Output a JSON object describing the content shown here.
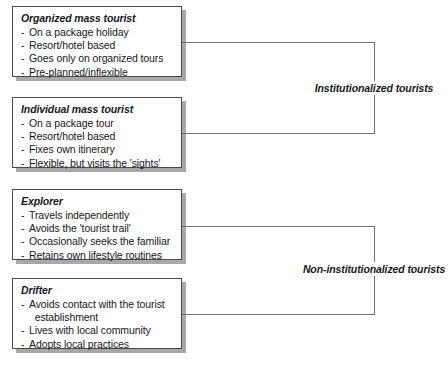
{
  "diagram": {
    "line_color": "#6f7276",
    "box_border_color": "#4a4a4a",
    "shadow_color": "#a8a8a8",
    "text_color": "#16181c",
    "boxes": [
      {
        "id": "organized-mass-tourist",
        "title": "Organized mass tourist",
        "bullets": [
          "On a package holiday",
          "Resort/hotel based",
          "Goes only on organized tours",
          "Pre-planned/inflexible"
        ]
      },
      {
        "id": "individual-mass-tourist",
        "title": "Individual mass tourist",
        "bullets": [
          "On a package tour",
          "Resort/hotel based",
          "Fixes own itinerary",
          "Flexible, but visits the 'sights'"
        ]
      },
      {
        "id": "explorer",
        "title": "Explorer",
        "bullets": [
          "Travels independently",
          "Avoids the 'tourist trail'",
          "Occasionally seeks the familiar",
          "Retains own lifestyle routines"
        ]
      },
      {
        "id": "drifter",
        "title": "Drifter",
        "bullets": [
          "Avoids contact with the tourist\n  establishment",
          "Lives with local community",
          "Adopts local practices"
        ]
      }
    ],
    "group_labels": [
      {
        "id": "institutionalized-tourists",
        "text": "Institutionalized tourists"
      },
      {
        "id": "non-institutionalized-tourists",
        "text": "Non-institutionalized tourists"
      }
    ]
  }
}
